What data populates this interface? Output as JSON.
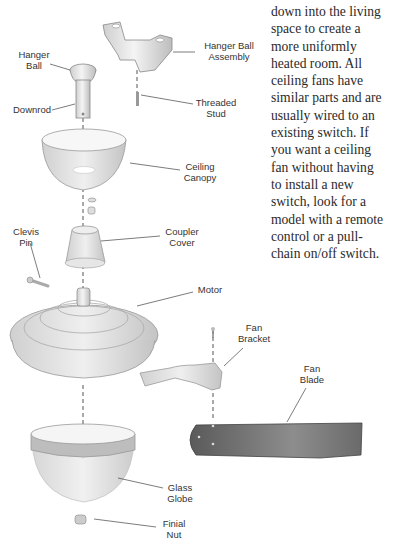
{
  "body_text": {
    "lines": [
      "down into the living",
      "space to create a",
      "more uniformly",
      "heated room. All",
      "ceiling fans have",
      "similar parts and are",
      "usually wired to an",
      "existing switch. If",
      "you want a ceiling",
      "fan without having",
      "to install a new",
      "switch, look for a",
      "model with a remote",
      "control or a pull-",
      "chain on/off switch."
    ]
  },
  "diagram": {
    "labels": {
      "hanger_ball": "Hanger\nBall",
      "hanger_ball_assembly": "Hanger Ball\nAssembly",
      "downrod": "Downrod",
      "threaded_stud": "Threaded\nStud",
      "ceiling_canopy": "Ceiling\nCanopy",
      "clevis_pin": "Clevis\nPin",
      "coupler_cover": "Coupler\nCover",
      "motor": "Motor",
      "fan_bracket": "Fan\nBracket",
      "fan_blade": "Fan\nBlade",
      "glass_globe": "Glass\nGlobe",
      "finial_nut": "Finial\nNut"
    }
  }
}
